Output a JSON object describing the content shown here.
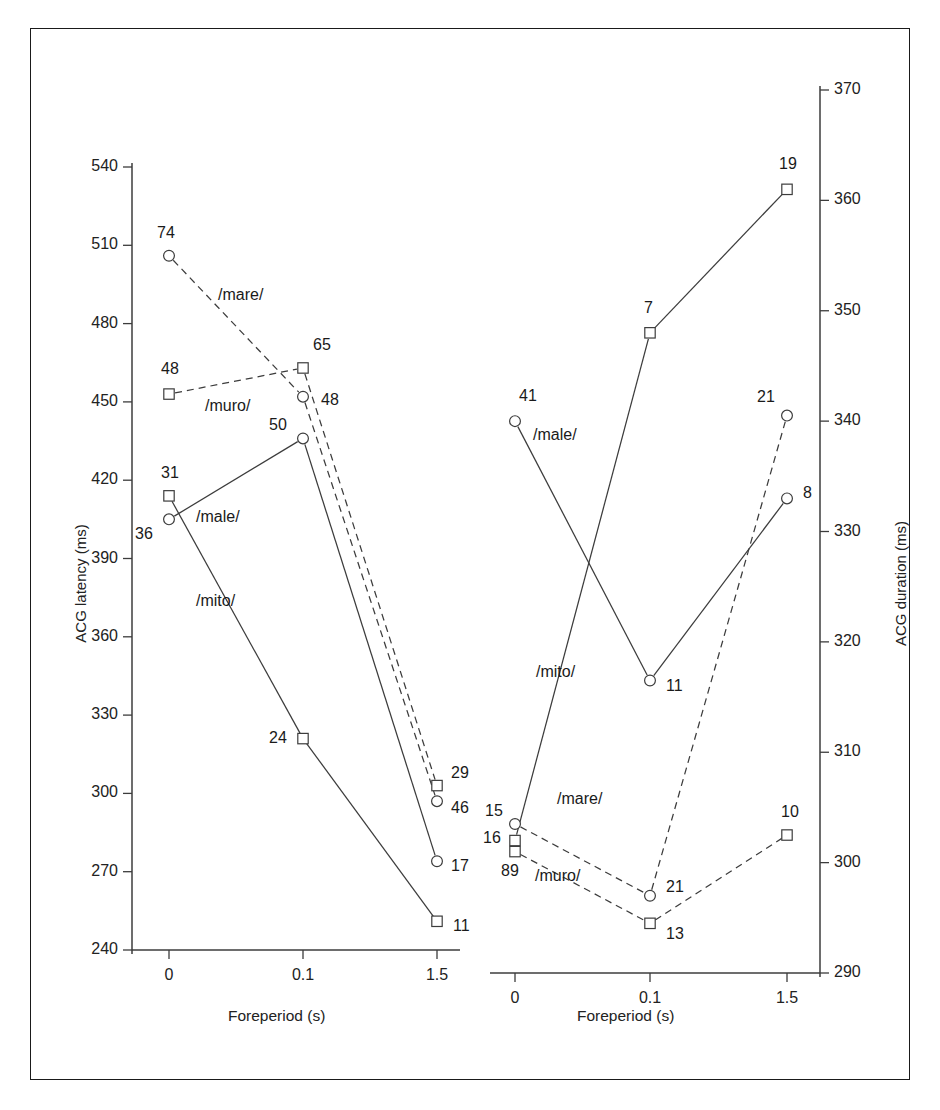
{
  "figure": {
    "background": "#ffffff",
    "border_color": "#1a1a1a",
    "line_color": "#3c3c3c",
    "text_color": "#1a1a1a"
  },
  "chart_data": [
    {
      "type": "line",
      "panel": "left",
      "title": "",
      "xlabel": "Foreperiod (s)",
      "ylabel": "ACG latency (ms)",
      "x": [
        "0",
        "0.1",
        "1.5"
      ],
      "xticklabels": [
        "0",
        "0.1",
        "1.5"
      ],
      "ylim": [
        240,
        540
      ],
      "yticks": [
        240,
        270,
        300,
        330,
        360,
        390,
        420,
        450,
        480,
        510,
        540
      ],
      "yticklabels": [
        "240",
        "270",
        "300",
        "330",
        "360",
        "390",
        "420",
        "450",
        "480",
        "510",
        "540"
      ],
      "grid": false,
      "legend": "inline-annotations",
      "series": [
        {
          "name": "/mare/",
          "marker": "circle",
          "linestyle": "dashed",
          "values": [
            506,
            452,
            297
          ],
          "point_labels": [
            "74",
            "48",
            "46"
          ],
          "label_text": "/mare/"
        },
        {
          "name": "/muro/",
          "marker": "square",
          "linestyle": "dashed",
          "values": [
            453,
            463,
            303
          ],
          "point_labels": [
            "48",
            "65",
            "29"
          ],
          "label_text": "/muro/"
        },
        {
          "name": "/male/",
          "marker": "circle",
          "linestyle": "solid",
          "values": [
            405,
            436,
            274
          ],
          "point_labels": [
            "36",
            "50",
            "17"
          ],
          "label_text": "/male/"
        },
        {
          "name": "/mito/",
          "marker": "square",
          "linestyle": "solid",
          "values": [
            414,
            321,
            251
          ],
          "point_labels": [
            "31",
            "24",
            "11"
          ],
          "label_text": "/mito/"
        }
      ]
    },
    {
      "type": "line",
      "panel": "right",
      "title": "",
      "xlabel": "Foreperiod (s)",
      "ylabel": "ACG duration (ms)",
      "x": [
        "0",
        "0.1",
        "1.5"
      ],
      "xticklabels": [
        "0",
        "0.1",
        "1.5"
      ],
      "ylim": [
        290,
        370
      ],
      "yticks": [
        290,
        300,
        310,
        320,
        330,
        340,
        350,
        360,
        370
      ],
      "yticklabels": [
        "290",
        "300",
        "310",
        "320",
        "330",
        "340",
        "350",
        "360",
        "370"
      ],
      "grid": false,
      "legend": "inline-annotations",
      "series": [
        {
          "name": "/male/",
          "marker": "circle",
          "linestyle": "solid",
          "values": [
            340,
            316.5,
            333
          ],
          "point_labels": [
            "41",
            "11",
            "8"
          ],
          "label_text": "/male/"
        },
        {
          "name": "/mito/",
          "marker": "square",
          "linestyle": "solid",
          "values": [
            302,
            348,
            361
          ],
          "point_labels": [
            "16",
            "7",
            "19"
          ],
          "label_text": "/mito/"
        },
        {
          "name": "/mare/",
          "marker": "circle",
          "linestyle": "dashed",
          "values": [
            303.5,
            297,
            340.5
          ],
          "point_labels": [
            "15",
            "21",
            "21"
          ],
          "label_text": "/mare/"
        },
        {
          "name": "/muro/",
          "marker": "square",
          "linestyle": "dashed",
          "values": [
            301,
            294.5,
            302.5
          ],
          "point_labels": [
            "89",
            "13",
            "10"
          ],
          "label_text": "/muro/"
        }
      ]
    }
  ]
}
